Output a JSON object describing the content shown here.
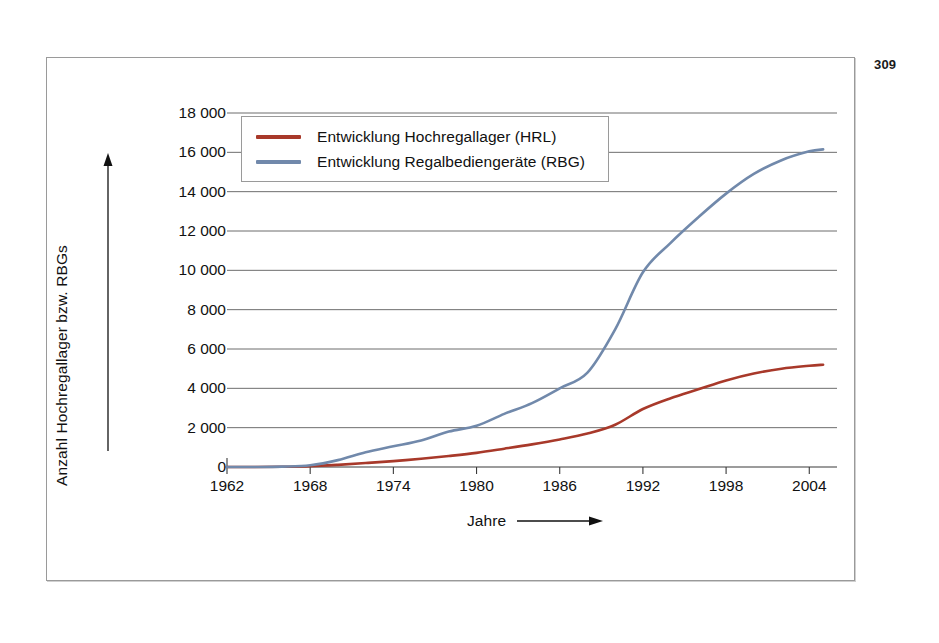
{
  "page_number": "309",
  "chart_data": {
    "type": "line",
    "title": "",
    "xlabel": "Jahre",
    "ylabel": "Anzahl Hochregallager bzw. RBGs",
    "xlim": [
      1962,
      2006
    ],
    "ylim": [
      0,
      18000
    ],
    "grid": true,
    "legend_position": "top-left-inside",
    "x_ticks": [
      "1962",
      "1968",
      "1974",
      "1980",
      "1986",
      "1992",
      "1998",
      "2004"
    ],
    "x_tick_values": [
      1962,
      1968,
      1974,
      1980,
      1986,
      1992,
      1998,
      2004
    ],
    "y_ticks": [
      "0",
      "2 000",
      "4 000",
      "6 000",
      "8 000",
      "10 000",
      "12 000",
      "14 000",
      "16 000",
      "18 000"
    ],
    "y_tick_values": [
      0,
      2000,
      4000,
      6000,
      8000,
      10000,
      12000,
      14000,
      16000,
      18000
    ],
    "x": [
      1962,
      1964,
      1966,
      1968,
      1970,
      1972,
      1974,
      1976,
      1978,
      1980,
      1982,
      1984,
      1986,
      1988,
      1990,
      1992,
      1994,
      1996,
      1998,
      2000,
      2002,
      2004,
      2005
    ],
    "series": [
      {
        "name": "Entwicklung Hochregallager (HRL)",
        "key": "hrl",
        "color": "#a8392a",
        "values": [
          0,
          0,
          10,
          40,
          110,
          200,
          300,
          420,
          560,
          720,
          930,
          1150,
          1400,
          1700,
          2150,
          2950,
          3500,
          3950,
          4400,
          4750,
          5000,
          5150,
          5200
        ]
      },
      {
        "name": "Entwicklung Regalbediengeräte (RBG)",
        "key": "rbg",
        "color": "#7189ab",
        "values": [
          0,
          0,
          20,
          90,
          350,
          750,
          1050,
          1350,
          1800,
          2100,
          2700,
          3250,
          4000,
          4800,
          7000,
          9900,
          11400,
          12700,
          13900,
          14900,
          15600,
          16050,
          16150
        ]
      }
    ],
    "axis_arrows": {
      "y": "up-arrow",
      "x": "right-arrow"
    }
  }
}
